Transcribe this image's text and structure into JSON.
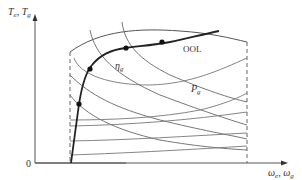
{
  "diagram": {
    "y_axis_label_main": "T",
    "y_axis_label_sub1": "e",
    "y_axis_label_sep": ", ",
    "y_axis_label_main2": "T",
    "y_axis_label_sub2": "g",
    "x_axis_label_main": "ω",
    "x_axis_label_sub1": "e",
    "x_axis_label_sep": ", ",
    "x_axis_label_main2": "ω",
    "x_axis_label_sub2": "g",
    "origin_label": "0",
    "curve_labels": {
      "ool": "OOL",
      "efficiency_main": "η",
      "efficiency_sub": "g",
      "power_main": "P",
      "power_sub": "g"
    },
    "colors": {
      "axis": "#555555",
      "ool_line": "#222222",
      "contour": "#777777",
      "point": "#111111"
    }
  }
}
